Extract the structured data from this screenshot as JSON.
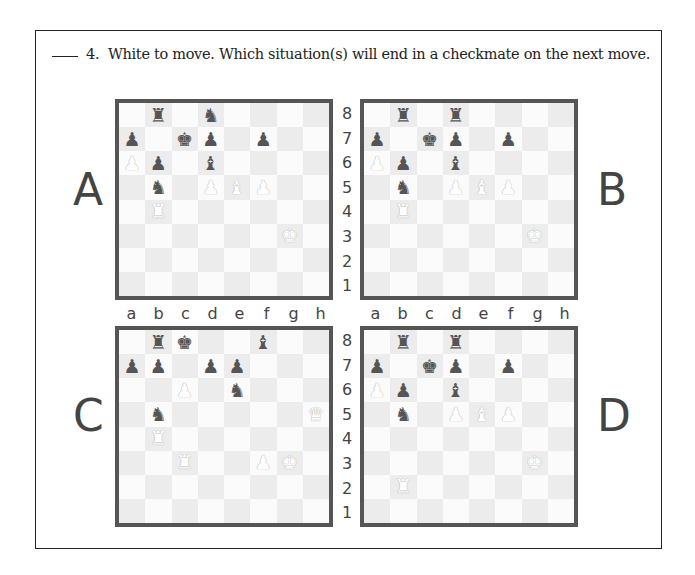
{
  "question": {
    "number": "4.",
    "text": "White to move.  Which situation(s) will end in a checkmate on the next move."
  },
  "labels": {
    "A": "A",
    "B": "B",
    "C": "C",
    "D": "D"
  },
  "files": [
    "a",
    "b",
    "c",
    "d",
    "e",
    "f",
    "g",
    "h"
  ],
  "ranks": [
    "8",
    "7",
    "6",
    "5",
    "4",
    "3",
    "2",
    "1"
  ],
  "colors": {
    "board_border": "#555555",
    "dark_square": "#ececec",
    "light_square": "#fbfbfb",
    "black_piece": "#555555",
    "white_piece": "#ffffff"
  },
  "boards": {
    "A": {
      "pieces": {
        "b8": "bR",
        "d8": "bN",
        "a7": "bP",
        "c7": "bK",
        "d7": "bP",
        "f7": "bP",
        "a6": "wP",
        "b6": "bP",
        "d6": "bB",
        "b5": "bN",
        "d5": "wP",
        "e5": "wB",
        "f5": "wP",
        "b4": "wR",
        "g3": "wK"
      }
    },
    "B": {
      "pieces": {
        "b8": "bR",
        "d8": "bR",
        "a7": "bP",
        "c7": "bK",
        "d7": "bP",
        "f7": "bP",
        "a6": "wP",
        "b6": "bP",
        "d6": "bB",
        "b5": "bN",
        "d5": "wP",
        "e5": "wB",
        "f5": "wP",
        "b4": "wR",
        "g3": "wK"
      }
    },
    "C": {
      "pieces": {
        "b8": "bR",
        "c8": "bK",
        "f8": "bB",
        "a7": "bP",
        "b7": "bP",
        "d7": "bP",
        "e7": "bP",
        "c6": "wP",
        "e6": "bN",
        "b5": "bN",
        "h5": "wQ",
        "b4": "wR",
        "c3": "wR",
        "f3": "wP",
        "g3": "wK"
      }
    },
    "D": {
      "pieces": {
        "b8": "bR",
        "d8": "bR",
        "a7": "bP",
        "c7": "bK",
        "d7": "bP",
        "f7": "bP",
        "a6": "wP",
        "b6": "bP",
        "d6": "bB",
        "b5": "bN",
        "d5": "wP",
        "e5": "wB",
        "f5": "wP",
        "g3": "wK",
        "b2": "wR"
      }
    }
  },
  "glyphs": {
    "K": "♚",
    "Q": "♛",
    "R": "♜",
    "B": "♝",
    "N": "♞",
    "P": "♟"
  }
}
